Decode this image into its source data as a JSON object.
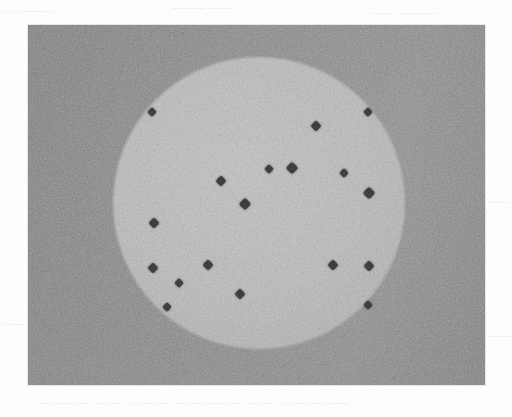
{
  "page": {
    "width": 512,
    "height": 417,
    "background_color": "#fdfdfd",
    "kind": "scanned-grayscale-figure"
  },
  "figure": {
    "name": "particle-distribution-micrograph",
    "panel": {
      "x": 28,
      "y": 25,
      "width": 457,
      "height": 360,
      "background_color": "#8d8d8d",
      "description": "Uniform noisy mid-gray field"
    },
    "disc": {
      "label": "bright circular disc",
      "center_x": 259,
      "center_y": 203,
      "radius": 146,
      "fill_color": "#bcbcbc",
      "edge_softness_px": 3
    },
    "particles": {
      "label": "dark particle markers",
      "count": 18,
      "color": "#3a3a3a",
      "shape": "diamond",
      "items": [
        {
          "id": "p1",
          "x": 152,
          "y": 112,
          "size": 7,
          "note": "upper-left, on disc rim"
        },
        {
          "id": "p2",
          "x": 368,
          "y": 112,
          "size": 7,
          "note": "upper-right, on disc rim"
        },
        {
          "id": "p3",
          "x": 316,
          "y": 126,
          "size": 8
        },
        {
          "id": "p4",
          "x": 269,
          "y": 169,
          "size": 7
        },
        {
          "id": "p5",
          "x": 292,
          "y": 168,
          "size": 9
        },
        {
          "id": "p6",
          "x": 344,
          "y": 173,
          "size": 7
        },
        {
          "id": "p7",
          "x": 221,
          "y": 181,
          "size": 8
        },
        {
          "id": "p8",
          "x": 369,
          "y": 193,
          "size": 9
        },
        {
          "id": "p9",
          "x": 245,
          "y": 204,
          "size": 9,
          "note": "near disc centre"
        },
        {
          "id": "p10",
          "x": 154,
          "y": 223,
          "size": 8
        },
        {
          "id": "p11",
          "x": 153,
          "y": 268,
          "size": 8
        },
        {
          "id": "p12",
          "x": 208,
          "y": 265,
          "size": 8
        },
        {
          "id": "p13",
          "x": 333,
          "y": 265,
          "size": 8
        },
        {
          "id": "p14",
          "x": 369,
          "y": 266,
          "size": 8
        },
        {
          "id": "p15",
          "x": 179,
          "y": 283,
          "size": 7
        },
        {
          "id": "p16",
          "x": 240,
          "y": 294,
          "size": 8
        },
        {
          "id": "p17",
          "x": 167,
          "y": 307,
          "size": 7
        },
        {
          "id": "p18",
          "x": 368,
          "y": 305,
          "size": 7,
          "note": "lower-right, on disc rim"
        }
      ]
    }
  },
  "ghost_text": {
    "note": "faint scan bleed-through from the reverse page; not legible",
    "top_left": "— ———",
    "top_mid": "———  ——",
    "top_right": "——  ———",
    "mid_right": "——",
    "low_left": "——",
    "low_right": "——",
    "bottom": "———— —— ——— —————  —— —————"
  }
}
